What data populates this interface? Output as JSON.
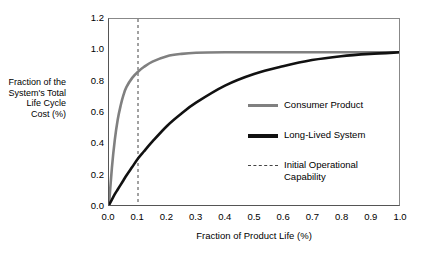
{
  "chart_data": {
    "type": "line",
    "title": "",
    "subtitle": "",
    "xlabel": "Fraction of Product Life (%)",
    "ylabel": "Fraction of the System's Total Life Cycle Cost (%)",
    "ylabel_lines": [
      "Fraction of the",
      "System's Total",
      "Life Cycle",
      "Cost (%)"
    ],
    "xlim": [
      0.0,
      1.0
    ],
    "ylim": [
      0.0,
      1.2
    ],
    "xticks": [
      "0.0",
      "0.1",
      "0.2",
      "0.3",
      "0.4",
      "0.5",
      "0.6",
      "0.7",
      "0.8",
      "0.9",
      "1.0"
    ],
    "xtick_values": [
      0.0,
      0.1,
      0.2,
      0.3,
      0.4,
      0.5,
      0.6,
      0.7,
      0.8,
      0.9,
      1.0
    ],
    "yticks": [
      "0.0",
      "0.2",
      "0.4",
      "0.6",
      "0.8",
      "1.0",
      "1.2"
    ],
    "ytick_values": [
      0.0,
      0.2,
      0.4,
      0.6,
      0.8,
      1.0,
      1.2
    ],
    "grid": false,
    "legend_position": "center-right",
    "x": [
      0.0,
      0.01,
      0.02,
      0.03,
      0.04,
      0.05,
      0.06,
      0.08,
      0.1,
      0.12,
      0.15,
      0.2,
      0.25,
      0.3,
      0.4,
      0.5,
      0.6,
      0.7,
      0.8,
      0.9,
      1.0
    ],
    "series": [
      {
        "name": "Consumer Product",
        "color": "#808080",
        "width": 2.6,
        "style": "solid",
        "values": [
          0.0,
          0.24,
          0.42,
          0.55,
          0.64,
          0.71,
          0.76,
          0.82,
          0.86,
          0.89,
          0.925,
          0.96,
          0.975,
          0.982,
          0.985,
          0.985,
          0.985,
          0.985,
          0.985,
          0.985,
          0.985
        ]
      },
      {
        "name": "Long-Lived System",
        "color": "#111111",
        "width": 2.6,
        "style": "solid",
        "values": [
          0.0,
          0.035,
          0.07,
          0.1,
          0.13,
          0.16,
          0.19,
          0.245,
          0.3,
          0.345,
          0.41,
          0.51,
          0.59,
          0.66,
          0.77,
          0.845,
          0.895,
          0.935,
          0.96,
          0.975,
          0.985
        ]
      }
    ],
    "annotations": [
      {
        "name": "Initial Operational Capability",
        "type": "vline",
        "x": 0.1,
        "style": "dashed",
        "color": "#444444"
      }
    ],
    "legend": [
      {
        "label": "Consumer Product",
        "marker": "solid-gray-line"
      },
      {
        "label": "Long-Lived System",
        "marker": "solid-black-line"
      },
      {
        "label": "Initial Operational Capability",
        "marker": "dashed-line"
      }
    ]
  },
  "axes": {
    "x_title": "Fraction of Product Life (%)",
    "y_title_lines": [
      "Fraction of the",
      "System's Total",
      "Life Cycle",
      "Cost (%)"
    ]
  },
  "legend": {
    "consumer_label": "Consumer Product",
    "longlived_label": "Long-Lived System",
    "ioc_label": "Initial Operational Capability"
  }
}
